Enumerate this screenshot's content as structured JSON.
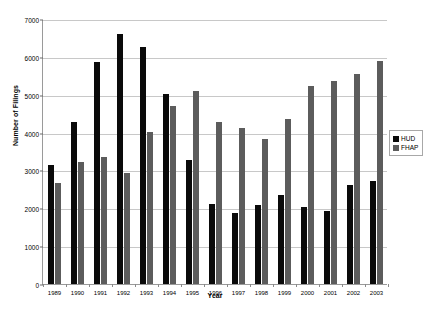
{
  "chart_data": {
    "type": "bar",
    "title": "",
    "xlabel": "Year",
    "ylabel": "Number of Filings",
    "categories": [
      "1989",
      "1990",
      "1991",
      "1992",
      "1993",
      "1994",
      "1995",
      "1996",
      "1997",
      "1998",
      "1999",
      "2000",
      "2001",
      "2002",
      "2003"
    ],
    "series": [
      {
        "name": "HUD",
        "color": "#0a0a0a",
        "values": [
          3140,
          4290,
          5860,
          6600,
          6250,
          5010,
          3280,
          2110,
          1880,
          2100,
          2360,
          2030,
          1940,
          2610,
          2730
        ]
      },
      {
        "name": "FHAP",
        "color": "#5c5c5c",
        "values": [
          2660,
          3210,
          3360,
          2930,
          4010,
          4700,
          5110,
          4290,
          4120,
          3830,
          4350,
          5240,
          5370,
          5540,
          5900
        ]
      }
    ],
    "ylim": [
      0,
      7000
    ],
    "yticks": [
      0,
      1000,
      2000,
      3000,
      4000,
      5000,
      6000,
      7000
    ],
    "ytick_labels": [
      "0",
      "1000",
      "2000",
      "3000",
      "4000",
      "5000",
      "6000",
      "7000"
    ],
    "grid": true,
    "legend_position": "right"
  },
  "legend": {
    "entries": [
      {
        "label": "HUD",
        "color": "#0a0a0a"
      },
      {
        "label": "FHAP",
        "color": "#5c5c5c"
      }
    ]
  }
}
